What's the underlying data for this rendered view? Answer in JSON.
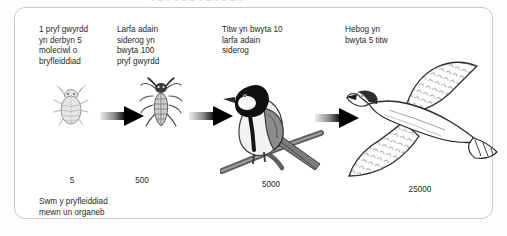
{
  "page": {
    "clipped_text_above": "y  g  y   y  g   p y      g y                p      p y",
    "background_color": "#fdfdfd",
    "frame_border_color": "#c9c9c9"
  },
  "diagram": {
    "type": "food-chain-flow",
    "bottom_caption": "Swm y pryfleiddiad\nmewn un organeb",
    "stages": [
      {
        "index": 1,
        "caption": "1 pryf gwyrdd\nyn derbyn 5\nmoleciwl o\nbryfleiddiad",
        "organism": "greenfly-aphid",
        "organism_icon": "aphid-icon",
        "amount": "5"
      },
      {
        "index": 2,
        "caption": "Larfa adain\nsiderog yn\nbwyta 100\npryf gwyrdd",
        "organism": "lacewing-larva",
        "organism_icon": "larva-icon",
        "amount": "500"
      },
      {
        "index": 3,
        "caption": "Titw yn bwyta 10\nlarfa adain\nsiderog",
        "organism": "tit-bird",
        "organism_icon": "tit-bird-icon",
        "amount": "5000"
      },
      {
        "index": 4,
        "caption": "Hebog yn\nbwyta 5 titw",
        "organism": "hawk",
        "organism_icon": "hawk-icon",
        "amount": "25000"
      }
    ],
    "arrows": [
      {
        "index": 1,
        "from": "greenfly-aphid",
        "to": "lacewing-larva"
      },
      {
        "index": 2,
        "from": "lacewing-larva",
        "to": "tit-bird"
      },
      {
        "index": 3,
        "from": "tit-bird",
        "to": "hawk"
      }
    ],
    "colors": {
      "arrow_head": "#000000",
      "arrow_tail_fade": "#e8e8e8",
      "text": "#1f1f1f",
      "art_dark": "#1a1a1a",
      "art_mid": "#8d8d8d",
      "art_light": "#d8d8d8"
    }
  }
}
